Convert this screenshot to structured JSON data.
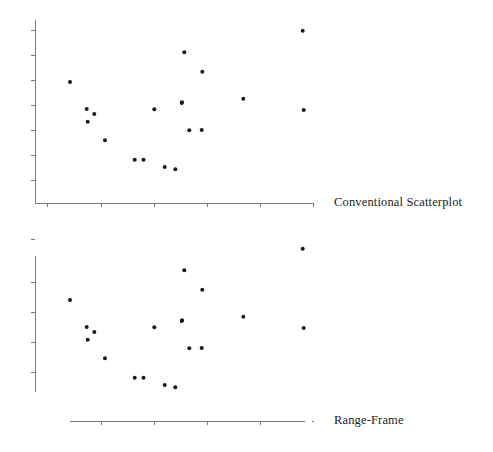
{
  "figure": {
    "background_color": "#ffffff",
    "ink_color": "#2b2b2b",
    "axis_color": "#7a7a7a",
    "point_color": "#1a1a1a"
  },
  "panels": [
    {
      "id": "conventional",
      "label": "Conventional Scatterplot",
      "label_x": 334,
      "label_y": 196,
      "frame_type": "conventional",
      "axis": {
        "x_line": {
          "x1": 35,
          "x2": 313,
          "y": 203
        },
        "y_line": {
          "x": 35,
          "y1": 20,
          "y2": 203
        },
        "x_ticks": [
          47,
          101,
          154,
          207,
          260,
          313
        ],
        "y_ticks": [
          30,
          55,
          80,
          105,
          130,
          155,
          180
        ],
        "tick_length": 4
      }
    },
    {
      "id": "range-frame",
      "label": "Range-Frame",
      "label_x": 334,
      "label_y": 414,
      "frame_type": "range-frame",
      "axis": {
        "x_line": {
          "x1": 70,
          "x2": 305,
          "y": 421
        },
        "x_end_mark": {
          "x": 312,
          "y": 421
        },
        "y_line": {
          "x": 35,
          "y1": 256,
          "y2": 392
        },
        "y_top_mark": {
          "x": 35,
          "y": 239
        },
        "x_ticks": [
          101,
          154,
          207,
          260
        ],
        "y_ticks": [
          282,
          312,
          342,
          372
        ],
        "tick_length": 4
      }
    }
  ],
  "chart_data": {
    "type": "scatter",
    "title": "",
    "xlabel": "",
    "ylabel": "",
    "grid": false,
    "legend": "none",
    "n_points": 19,
    "note": "Same 19-point scatter drawn twice: once with a conventional full box-less L frame, once with a Tufte range-frame whose axis lines span only the data range.",
    "xlim": [
      0,
      10
    ],
    "ylim": [
      0,
      10
    ],
    "series": [
      {
        "name": "observations",
        "marker": "filled-circle",
        "marker_size": 3.2,
        "color": "#1a1a1a",
        "points": [
          {
            "x": 1.32,
            "y": 6.76,
            "px": 70.0,
            "py": 82.0
          },
          {
            "x": 1.92,
            "y": 5.28,
            "px": 86.7,
            "py": 109.0
          },
          {
            "x": 2.2,
            "y": 4.99,
            "px": 94.3,
            "py": 114.0
          },
          {
            "x": 1.95,
            "y": 4.57,
            "px": 87.7,
            "py": 121.7
          },
          {
            "x": 2.57,
            "y": 3.54,
            "px": 105.0,
            "py": 140.3
          },
          {
            "x": 3.61,
            "y": 2.46,
            "px": 134.7,
            "py": 159.7
          },
          {
            "x": 3.93,
            "y": 2.46,
            "px": 143.5,
            "py": 159.7
          },
          {
            "x": 4.3,
            "y": 5.26,
            "px": 154.3,
            "py": 109.3
          },
          {
            "x": 4.68,
            "y": 2.06,
            "px": 164.7,
            "py": 167.0
          },
          {
            "x": 5.05,
            "y": 1.93,
            "px": 175.3,
            "py": 169.3
          },
          {
            "x": 5.36,
            "y": 7.85,
            "px": 184.3,
            "py": 52.3
          },
          {
            "x": 5.28,
            "y": 5.39,
            "px": 181.7,
            "py": 103.0
          },
          {
            "x": 5.55,
            "y": 3.9,
            "px": 189.3,
            "py": 130.3
          },
          {
            "x": 5.98,
            "y": 3.91,
            "px": 201.7,
            "py": 130.0
          },
          {
            "x": 6.0,
            "y": 7.45,
            "px": 202.3,
            "py": 71.7
          },
          {
            "x": 7.5,
            "y": 5.66,
            "px": 243.3,
            "py": 98.7
          },
          {
            "x": 9.65,
            "y": 9.09,
            "px": 302.7,
            "py": 30.7
          },
          {
            "x": 9.68,
            "y": 5.21,
            "px": 303.7,
            "py": 110.0
          },
          {
            "x": 5.28,
            "y": 4.58,
            "px": 182.0,
            "py": 102.3
          }
        ]
      }
    ]
  }
}
